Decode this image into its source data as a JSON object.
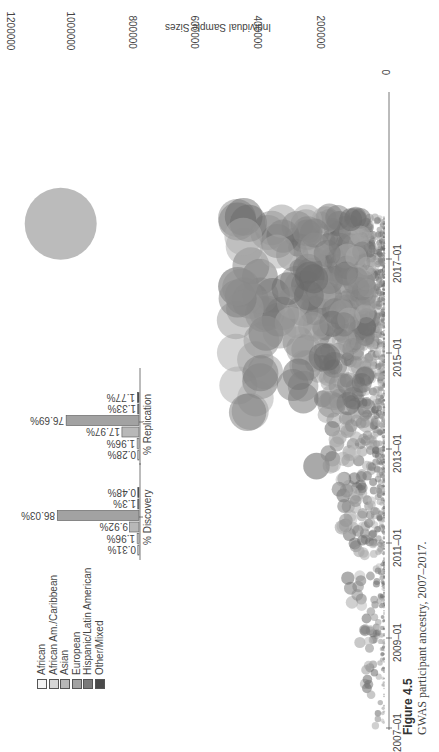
{
  "figure": {
    "label": "Figure 4.5",
    "caption": "GWAS participant ancestry, 2007–2017."
  },
  "chart_data": [
    {
      "type": "scatter",
      "subtype": "bubble",
      "title": "",
      "xlabel": "",
      "ylabel": "Individual Sample Sizes",
      "x_tick_labels": [
        "2007–01",
        "2009–01",
        "2011–01",
        "2013–01",
        "2015–01",
        "2017–01"
      ],
      "y_tick_labels": [
        "0",
        "200000",
        "400000",
        "600000",
        "800000",
        "1000000",
        "1200000"
      ],
      "ylim": [
        0,
        1200000
      ],
      "xlim": [
        "2007-01",
        "2017-12"
      ],
      "grid": false,
      "orientation": "rotated 90° clockwise on page",
      "legend": {
        "position": "bottom-left (rotated)",
        "entries": [
          {
            "label": "African",
            "color": "#f4f4f4"
          },
          {
            "label": "African Am./Caribbean",
            "color": "#d6d6d6"
          },
          {
            "label": "Asian",
            "color": "#b8b8b8"
          },
          {
            "label": "European",
            "color": "#a2a2a2"
          },
          {
            "label": "Hispanic/Latin American",
            "color": "#7a7a7a"
          },
          {
            "label": "Other/Mixed",
            "color": "#4a4a4a"
          }
        ]
      },
      "notable_points": [
        {
          "date": "2017-10",
          "sample_size": 1030000,
          "group": "European",
          "note": "largest study"
        },
        {
          "date": "2016-06",
          "sample_size": 470000,
          "group": "European"
        },
        {
          "date": "2015-06",
          "sample_size": 380000,
          "group": "European"
        },
        {
          "date": "2012-08",
          "sample_size": 220000,
          "group": "Asian"
        }
      ]
    },
    {
      "type": "bar",
      "title": "% Discovery",
      "categories": [
        "African",
        "African Am./Caribbean",
        "Asian",
        "European",
        "Hispanic/Latin American",
        "Other/Mixed"
      ],
      "values": [
        0.31,
        1.96,
        9.92,
        86.03,
        1.3,
        0.48
      ],
      "value_labels": [
        "0.31%",
        "1.96%",
        "9.92%",
        "86.03%",
        "1.3%",
        "0.48%"
      ],
      "orientation": "horizontal (rotated)"
    },
    {
      "type": "bar",
      "title": "% Replication",
      "categories": [
        "African",
        "African Am./Caribbean",
        "Asian",
        "European",
        "Hispanic/Latin American",
        "Other/Mixed"
      ],
      "values": [
        0.28,
        1.96,
        17.97,
        76.69,
        1.33,
        1.77
      ],
      "value_labels": [
        "0.28%",
        "1.96%",
        "17.97%",
        "76.69%",
        "1.33%",
        "1.77%"
      ],
      "orientation": "horizontal (rotated)"
    }
  ],
  "colors": {
    "axis": "#555555",
    "text": "#444444",
    "bubble_light": "#a8a8a8",
    "bubble_dark": "#6e6e6e"
  }
}
